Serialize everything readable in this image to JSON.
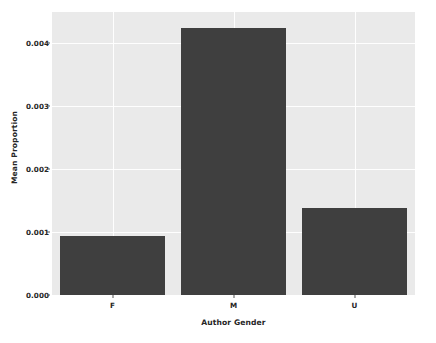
{
  "chart_data": {
    "type": "bar",
    "title": "",
    "xlabel": "Author Gender",
    "ylabel": "Mean Proportion",
    "categories": [
      "F",
      "M",
      "U"
    ],
    "values": [
      0.00094,
      0.00424,
      0.00138
    ],
    "ylim": [
      0.0,
      0.0045
    ],
    "xlim": [
      -0.5,
      2.5
    ],
    "ytick_labels": [
      "0.000",
      "0.001",
      "0.002",
      "0.003",
      "0.004"
    ],
    "ytick_values": [
      0.0,
      0.001,
      0.002,
      0.003,
      0.004
    ],
    "xtick_labels": [
      "F",
      "M",
      "U"
    ],
    "grid": true,
    "legend": "none",
    "series": [
      {
        "name": "Mean Proportion",
        "values": [
          0.00094,
          0.00424,
          0.00138
        ]
      }
    ],
    "colors": {
      "bar": "#3f3f3f",
      "plot_background": "#eaeaea",
      "figure_background": "#ffffff",
      "gridline": "#ffffff",
      "text": "#262626"
    }
  }
}
